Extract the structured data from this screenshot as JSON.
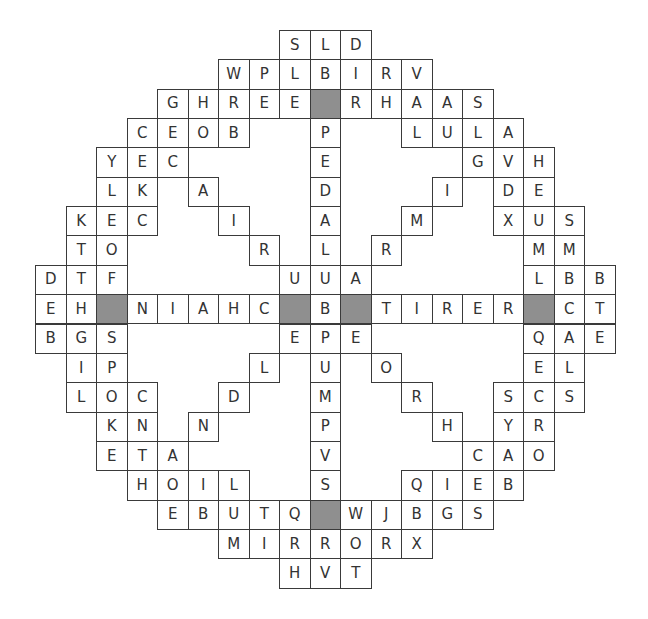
{
  "puzzle": {
    "type": "circular-word-search",
    "columns": 19,
    "rows_count": 19,
    "legend": {
      "space": "no cell",
      "#": "shaded block cell"
    },
    "colors": {
      "border": "#3a3a3a",
      "shaded": "#8f8f8f",
      "letter": "#333333",
      "background": "#ffffff"
    },
    "rows": [
      "        SLD        ",
      "      WPLBIRV      ",
      "    GHREE#RHAAS    ",
      "   CEOB  P  LULA   ",
      "  YEC    E    GVH  ",
      "  LK A   D   I DE  ",
      " KEC  I  A  M  XUS ",
      " TO    R L R    MM ",
      "DTF     UUA     LBB",
      "EH#NIAHC#B#TIRER#CT",
      "BGS     EPE     QAE",
      " IP    L U O    EL ",
      " LOC  D  M  R  SCS ",
      "  KN N   P   H YR  ",
      "  ETA    V    CAO  ",
      "   HOIL  S  QIEB   ",
      "    EBUTQ#WJBGS    ",
      "      MIRRORX      ",
      "        HVT        "
    ]
  }
}
